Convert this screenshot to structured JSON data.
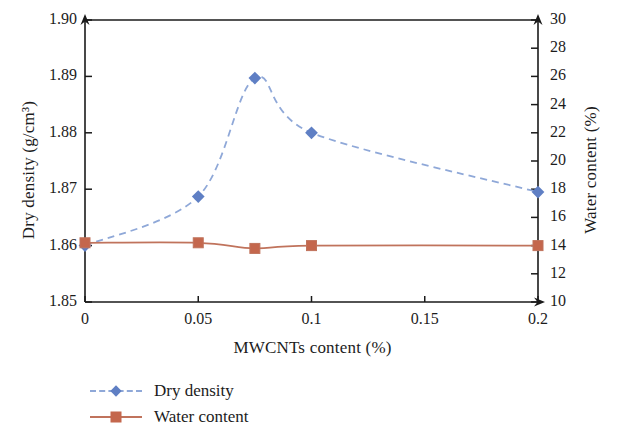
{
  "chart_data": {
    "type": "line",
    "title": "",
    "xlabel": "MWCNTs content (%)",
    "ylabel": "Dry density (g/cm³)",
    "y2label": "Water content (%)",
    "xlim": [
      0,
      0.2
    ],
    "ylim": [
      1.85,
      1.9
    ],
    "y2lim": [
      10,
      30
    ],
    "grid": false,
    "legend_position": "below-left",
    "xticks": [
      "0",
      "0.05",
      "0.1",
      "0.15",
      "0.2"
    ],
    "xtick_values": [
      0,
      0.05,
      0.1,
      0.15,
      0.2
    ],
    "yticks": [
      "1.85",
      "1.86",
      "1.87",
      "1.88",
      "1.89",
      "1.90"
    ],
    "ytick_values": [
      1.85,
      1.86,
      1.87,
      1.88,
      1.89,
      1.9
    ],
    "y2ticks": [
      "10",
      "12",
      "14",
      "16",
      "18",
      "20",
      "22",
      "24",
      "26",
      "28",
      "30"
    ],
    "y2tick_values": [
      10,
      12,
      14,
      16,
      18,
      20,
      22,
      24,
      26,
      28,
      30
    ],
    "x": [
      0,
      0.05,
      0.075,
      0.1,
      0.2
    ],
    "series": [
      {
        "name": "Dry density",
        "axis": "left",
        "color": "#5f7fc4",
        "line_color": "#8fa8d8",
        "line_style": "dashed",
        "marker": "diamond",
        "values": [
          1.86,
          1.8687,
          1.8897,
          1.88,
          1.8695
        ]
      },
      {
        "name": "Water content",
        "axis": "right",
        "color": "#c4674d",
        "line_color": "#c0735c",
        "line_style": "solid",
        "marker": "square",
        "values": [
          14.2,
          14.2,
          13.8,
          14.0,
          14.0
        ]
      }
    ]
  },
  "legend": {
    "items": [
      {
        "label": "Dry density",
        "marker": "diamond",
        "line_style": "dashed"
      },
      {
        "label": "Water content",
        "marker": "square",
        "line_style": "solid"
      }
    ]
  },
  "axes": {
    "left_title": "Dry density (g/cm³)",
    "right_title": "Water content (%)",
    "bottom_title": "MWCNTs content (%)"
  },
  "colors": {
    "dry_density": "#5f7fc4",
    "dry_density_line": "#8fa8d8",
    "water_content": "#c4674d",
    "water_content_line": "#c0735c",
    "axis": "#1a1a1a",
    "background": "#ffffff"
  }
}
